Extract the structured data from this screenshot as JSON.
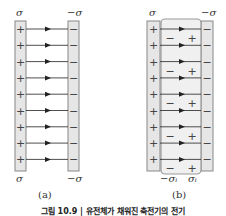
{
  "figure": {
    "panel_a": {
      "label": "(a)",
      "left_plate_charge_top": "σ",
      "right_plate_charge_top": "−σ",
      "left_plate_charge_bottom": "σ",
      "right_plate_charge_bottom": "−σ",
      "left_plate_sign": "+",
      "right_plate_sign": "−",
      "field_lines": 9
    },
    "panel_b": {
      "label": "(b)",
      "left_plate_charge_top": "σ",
      "right_plate_charge_top": "−σ",
      "dielectric_left_charge": "−σᵢ",
      "dielectric_right_charge": "σᵢ",
      "left_plate_sign": "+",
      "right_plate_sign": "−",
      "dielectric_pair_left": "−",
      "dielectric_pair_right": "+",
      "field_lines": 9,
      "dielectric_pairs": 5
    },
    "caption": "그림 10.9 | 유전체가 채워진 축전기의 전기"
  },
  "colors": {
    "plate_fill": "#e6e6e6",
    "plate_stroke": "#888888",
    "dielectric_fill": "#f0f0f0",
    "dielectric_stroke": "#999999",
    "line": "#222222"
  }
}
